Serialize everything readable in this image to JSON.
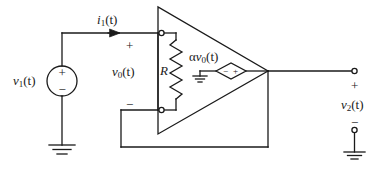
{
  "figure": {
    "type": "circuit-schematic",
    "stroke_color": "#1a1a1a",
    "background_color": "#ffffff"
  },
  "labels": {
    "source_voltage": {
      "symbol": "v",
      "subscript": "1",
      "arg": "(t)"
    },
    "input_current": {
      "symbol": "i",
      "subscript": "1",
      "arg": "(t)"
    },
    "control_voltage": {
      "symbol": "v",
      "subscript": "0",
      "arg": "(t)"
    },
    "dependent_source": {
      "prefix": "α",
      "symbol": "v",
      "subscript": "0",
      "arg": "(t)"
    },
    "resistor": "R",
    "output_voltage": {
      "symbol": "v",
      "subscript": "2",
      "arg": "(t)"
    }
  },
  "polarity_marks": {
    "source_plus": "+",
    "source_minus": "−",
    "input_plus": "+",
    "control_plus": "+",
    "control_minus": "−",
    "dep_source_minus": "−",
    "dep_source_plus": "+",
    "output_plus": "+",
    "output_minus": "−"
  },
  "components": [
    {
      "name": "independent-voltage-source",
      "kind": "circle-source",
      "label": "v1(t)"
    },
    {
      "name": "input-current-arrow",
      "kind": "arrow",
      "label": "i1(t)"
    },
    {
      "name": "resistor-R",
      "kind": "zigzag-resistor",
      "label": "R"
    },
    {
      "name": "dependent-voltage-source",
      "kind": "diamond-source",
      "label": "αv0(t)"
    },
    {
      "name": "amplifier-triangle",
      "kind": "triangle"
    },
    {
      "name": "ground-source",
      "kind": "earth-ground"
    },
    {
      "name": "ground-dependent-source",
      "kind": "earth-ground"
    },
    {
      "name": "ground-output",
      "kind": "earth-ground"
    },
    {
      "name": "output-terminal-top",
      "kind": "open-terminal"
    },
    {
      "name": "output-terminal-bottom",
      "kind": "open-terminal"
    },
    {
      "name": "resistor-terminal-top",
      "kind": "open-terminal"
    },
    {
      "name": "resistor-terminal-bottom",
      "kind": "open-terminal"
    }
  ]
}
